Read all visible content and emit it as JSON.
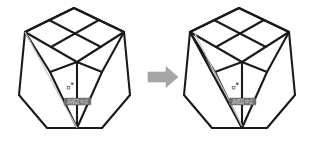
{
  "scene": {
    "background": "#ffffff",
    "stroke_color": "#1a1a1a",
    "guide_color": "#c9c9c9",
    "arrow_color": "#a6a6a6",
    "tooltip_bg": "#6e6e6e",
    "tooltip_fg": "#e8e8e8",
    "width": 319,
    "height": 145
  },
  "figures": [
    {
      "id": "before",
      "caption": "",
      "tooltip": "选择边中点",
      "cursor_icon": "crosshair-pick-icon",
      "guide_line": "visible",
      "new_edge": "absent"
    },
    {
      "id": "after",
      "caption": "",
      "tooltip": "选择边中点",
      "cursor_icon": "crosshair-pick-icon",
      "guide_line": "visible",
      "new_edge": "present"
    }
  ],
  "arrow": {
    "icon": "block-arrow-right-icon",
    "label": "",
    "direction": "right"
  },
  "watermark": {
    "text": ""
  }
}
